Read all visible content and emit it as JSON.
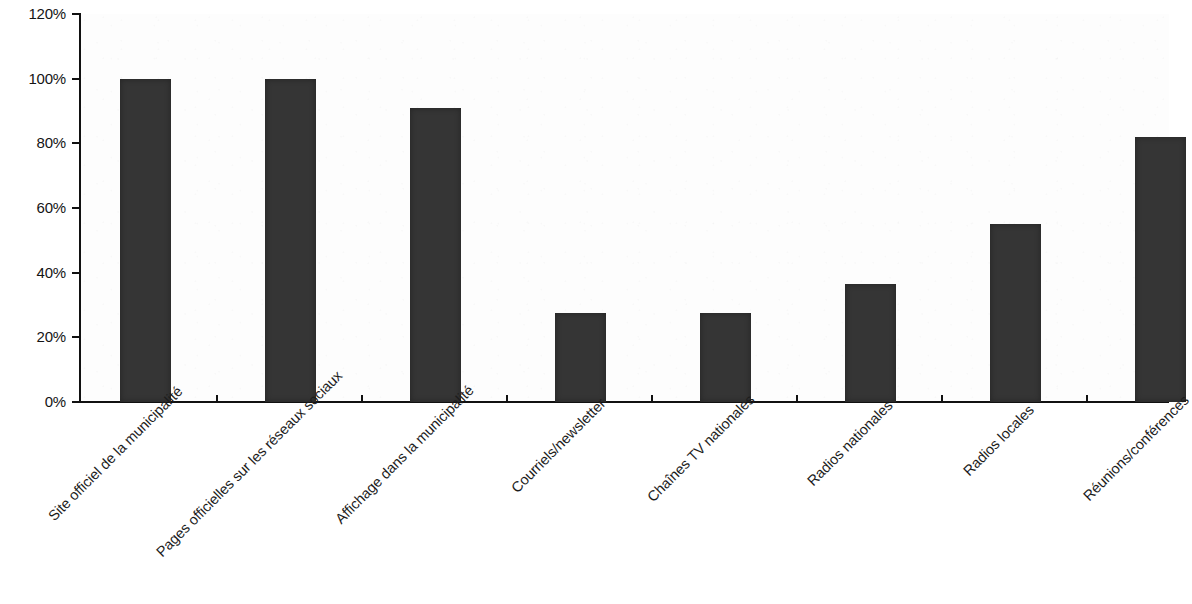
{
  "chart_data": {
    "type": "bar",
    "title": "",
    "subtitle": "",
    "xlabel": "",
    "ylabel": "",
    "ylim": [
      0,
      120
    ],
    "y_tick_step": 20,
    "y_tick_labels": [
      "120%",
      "100%",
      "80%",
      "60%",
      "40%",
      "20%",
      "0%"
    ],
    "y_tick_values": [
      120,
      100,
      80,
      60,
      40,
      20,
      0
    ],
    "grid": false,
    "legend": false,
    "legend_position": "none",
    "value_unit": "%",
    "bar_color": "#353535",
    "axis_color": "#111111",
    "background_color": "#fdfdfd",
    "label_rotation_deg": -45,
    "categories": [
      "Site officiel de la municipalité",
      "Pages officielles sur les réseaux sociaux",
      "Affichage dans la municipalité",
      "Courriels/newsletter",
      "Chaînes TV nationales",
      "Radios nationales",
      "Radios locales",
      "Réunions/conférences"
    ],
    "values": [
      100,
      100,
      91,
      27.5,
      27.5,
      36.5,
      55,
      82
    ]
  }
}
